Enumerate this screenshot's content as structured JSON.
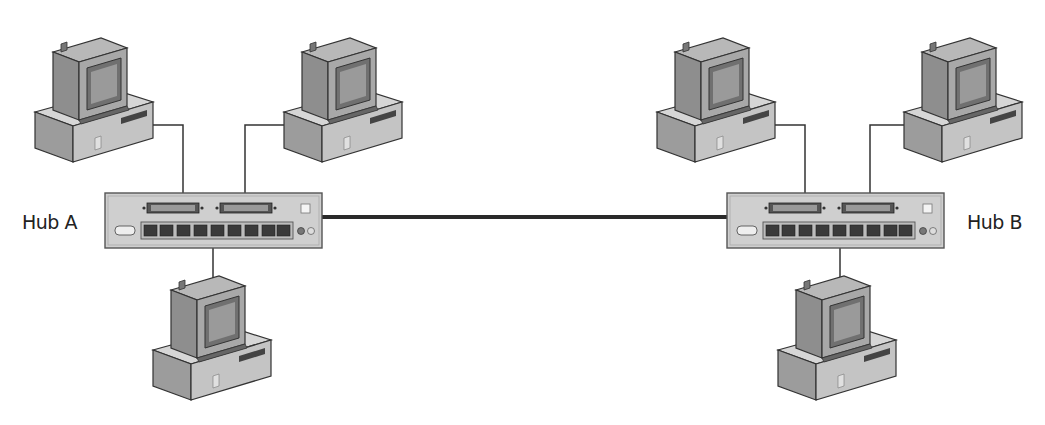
{
  "diagram": {
    "type": "network-topology",
    "hubs": [
      {
        "id": "hub-a",
        "label": "Hub A",
        "ports": 9
      },
      {
        "id": "hub-b",
        "label": "Hub B",
        "ports": 9
      }
    ],
    "computers": [
      {
        "id": "pc-a1",
        "hub": "hub-a",
        "position": "top-left"
      },
      {
        "id": "pc-a2",
        "hub": "hub-a",
        "position": "top-right"
      },
      {
        "id": "pc-a3",
        "hub": "hub-a",
        "position": "bottom"
      },
      {
        "id": "pc-b1",
        "hub": "hub-b",
        "position": "top-left"
      },
      {
        "id": "pc-b2",
        "hub": "hub-b",
        "position": "top-right"
      },
      {
        "id": "pc-b3",
        "hub": "hub-b",
        "position": "bottom"
      }
    ],
    "links": [
      {
        "from": "hub-a",
        "to": "hub-b",
        "kind": "backbone"
      }
    ]
  },
  "colors": {
    "background": "#ffffff",
    "device_fill": "#c8c8c8",
    "device_dark": "#8a8a8a",
    "outline": "#333333",
    "cable": "#333333"
  }
}
